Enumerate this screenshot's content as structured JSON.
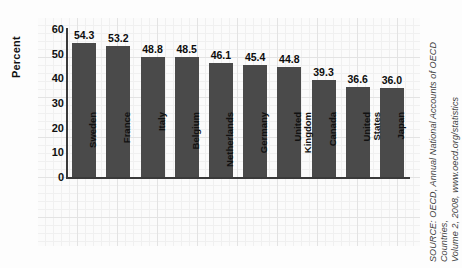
{
  "chart_data": {
    "type": "bar",
    "title": "",
    "xlabel": "",
    "ylabel": "Percent",
    "ylim": [
      0,
      60
    ],
    "yticks": [
      0,
      10,
      20,
      30,
      40,
      50,
      60
    ],
    "grid": true,
    "legend": "none",
    "categories": [
      "Sweden",
      "France",
      "Italy",
      "Belgium",
      "Netherlands",
      "Germany",
      "United\nKingdom",
      "Canada",
      "United\nStates",
      "Japan"
    ],
    "values": [
      54.3,
      53.2,
      48.8,
      48.5,
      46.1,
      45.4,
      44.8,
      39.3,
      36.6,
      36.0
    ],
    "value_labels": [
      "54.3",
      "53.2",
      "48.8",
      "48.5",
      "46.1",
      "45.4",
      "44.8",
      "39.3",
      "36.6",
      "36.0"
    ],
    "bar_color": "#4a4a4a",
    "axis_color": "#3a3a3a"
  },
  "source": {
    "text": "SOURCE: OECD, Annual National Accounts of OECD Countries,\nVolume 2, 2008, www.oecd.org/statistics"
  }
}
